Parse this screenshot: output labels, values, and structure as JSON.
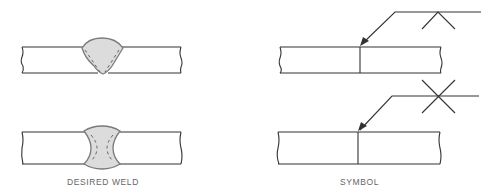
{
  "diagram": {
    "left_caption": "DESIRED WELD",
    "right_caption": "SYMBOL",
    "colors": {
      "line": "#333333",
      "weld_fill": "#dcdcdc",
      "weld_outline": "#7a7a7a",
      "caption": "#666666"
    }
  }
}
